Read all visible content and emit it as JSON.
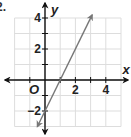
{
  "problem_number": "2.",
  "chart_data": {
    "type": "line",
    "title": "",
    "xlabel": "x",
    "ylabel": "y",
    "origin_label": "O",
    "xlim": [
      -2,
      5
    ],
    "ylim": [
      -3,
      4
    ],
    "grid": true,
    "x_ticks": [
      -1,
      1,
      2,
      3,
      4
    ],
    "y_ticks": [
      -2,
      -1,
      1,
      2,
      3,
      4
    ],
    "x_tick_labels": [
      {
        "value": 2,
        "label": "2"
      },
      {
        "value": 4,
        "label": "4"
      }
    ],
    "y_tick_labels": [
      {
        "value": 4,
        "label": "4"
      },
      {
        "value": 2,
        "label": "2"
      },
      {
        "value": -2,
        "label": "−2"
      }
    ],
    "series": [
      {
        "name": "line",
        "equation": "y = 2x - 2",
        "slope": 2,
        "intercept": -2,
        "points": [
          {
            "x": -0.5,
            "y": -3
          },
          {
            "x": 0,
            "y": -2
          },
          {
            "x": 1,
            "y": 0
          },
          {
            "x": 3.1,
            "y": 4.2
          }
        ],
        "arrows_both_ends": true,
        "color": "#777777"
      }
    ],
    "colors": {
      "axis": "#111111",
      "grid": "#dddddd",
      "line": "#777777"
    }
  }
}
